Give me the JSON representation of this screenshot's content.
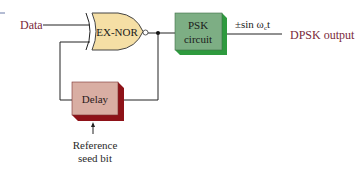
{
  "diagram": {
    "inputs": {
      "data_label": "Data",
      "reference_label_line1": "Reference",
      "reference_label_line2": "seed bit"
    },
    "blocks": {
      "exnor": {
        "label": "EX-NOR"
      },
      "psk": {
        "label_line1": "PSK",
        "label_line2": "circuit"
      },
      "delay": {
        "label": "Delay"
      }
    },
    "signals": {
      "carrier_prefix": "±sin ω",
      "carrier_subscript": "c",
      "carrier_suffix": "t",
      "output_label": "DPSK output"
    },
    "colors": {
      "label_text": "#7a2a3a",
      "gate_fill": "#f5dfa5",
      "psk_face": "#7dae84",
      "psk_edge": "#2e9a3e",
      "delay_face": "#d9aea3",
      "delay_edge": "#8e1218",
      "line": "#222222"
    }
  }
}
